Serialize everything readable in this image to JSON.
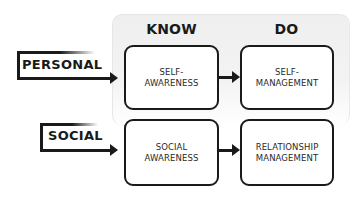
{
  "diagram": {
    "columns": [
      {
        "label": "KNOW"
      },
      {
        "label": "DO"
      }
    ],
    "rows": [
      {
        "label": "PERSONAL"
      },
      {
        "label": "SOCIAL"
      }
    ],
    "boxes": [
      {
        "label": "SELF-\nAWARENESS",
        "row": "PERSONAL",
        "column": "KNOW"
      },
      {
        "label": "SELF-\nMANAGEMENT",
        "row": "PERSONAL",
        "column": "DO"
      },
      {
        "label": "SOCIAL\nAWARENESS",
        "row": "SOCIAL",
        "column": "KNOW"
      },
      {
        "label": "RELATIONSHIP\nMANAGEMENT",
        "row": "SOCIAL",
        "column": "DO"
      }
    ],
    "edges": [
      {
        "from": "PERSONAL",
        "to": "SELF-AWARENESS"
      },
      {
        "from": "SELF-AWARENESS",
        "to": "SELF-MANAGEMENT"
      },
      {
        "from": "SOCIAL",
        "to": "SOCIAL AWARENESS"
      },
      {
        "from": "SOCIAL AWARENESS",
        "to": "RELATIONSHIP MANAGEMENT"
      }
    ],
    "colors": {
      "stroke": "#1a1a1a",
      "panel": "#efefef",
      "box_fill": "#ffffff"
    }
  }
}
